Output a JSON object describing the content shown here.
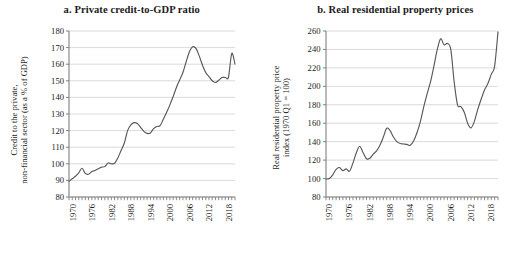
{
  "figure": {
    "background": "#ffffff",
    "line_color": "#595959",
    "grid_color": "#d0d0d0",
    "axis_color": "#808080"
  },
  "panels": [
    {
      "id": "panel-a",
      "title": "a. Private credit-to-GDP ratio",
      "ylabel_line1": "Credit to the private,",
      "ylabel_line2": "non-financial sector (as a % of GDP)"
    },
    {
      "id": "panel-b",
      "title": "b. Real residential property prices",
      "ylabel_line1": "Real residential property price",
      "ylabel_line2": "index (1970 Q1 = 100)"
    }
  ],
  "chart_data": [
    {
      "type": "line",
      "title": "a. Private credit-to-GDP ratio",
      "xlabel": "",
      "ylabel": "Credit to the private, non-financial sector (as a % of GDP)",
      "ylim": [
        80,
        180
      ],
      "ytick_values": [
        80,
        90,
        100,
        110,
        120,
        130,
        140,
        150,
        160,
        170,
        180
      ],
      "ytick_labels": [
        "80",
        "90",
        "100",
        "110",
        "120",
        "130",
        "140",
        "150",
        "160",
        "170",
        "180"
      ],
      "xlim": [
        1970,
        2021
      ],
      "xtick_labels": [
        "1970",
        "1976",
        "1982",
        "1988",
        "1994",
        "2000",
        "2006",
        "2012",
        "2018"
      ],
      "xtick_values": [
        1970,
        1976,
        1982,
        1988,
        1994,
        2000,
        2006,
        2012,
        2018
      ],
      "grid": true,
      "grid_axis": "y",
      "legend": "none",
      "x": [
        1970,
        1971,
        1972,
        1973,
        1974,
        1975,
        1976,
        1977,
        1978,
        1979,
        1980,
        1981,
        1982,
        1983,
        1984,
        1985,
        1986,
        1987,
        1988,
        1989,
        1990,
        1991,
        1992,
        1993,
        1994,
        1995,
        1996,
        1997,
        1998,
        1999,
        2000,
        2001,
        2002,
        2003,
        2004,
        2005,
        2006,
        2007,
        2008,
        2009,
        2010,
        2011,
        2012,
        2013,
        2014,
        2015,
        2016,
        2017,
        2018,
        2019,
        2020,
        2021
      ],
      "values": [
        89.5,
        91.0,
        92.5,
        94.5,
        97.3,
        94.2,
        93.7,
        95.3,
        96.0,
        97.0,
        98.0,
        98.3,
        100.5,
        100.0,
        100.3,
        103.5,
        108.0,
        112.5,
        120.0,
        123.5,
        124.8,
        124.3,
        122.0,
        119.5,
        118.3,
        118.6,
        121.2,
        122.5,
        123.0,
        127.0,
        131.0,
        135.5,
        140.5,
        146.0,
        150.5,
        155.0,
        161.5,
        167.5,
        170.5,
        169.5,
        165.0,
        159.5,
        155.0,
        152.5,
        150.0,
        149.0,
        150.3,
        152.0,
        152.0,
        152.3,
        166.5,
        160.0
      ]
    },
    {
      "type": "line",
      "title": "b. Real residential property prices",
      "xlabel": "",
      "ylabel": "Real residential property price index (1970 Q1 = 100)",
      "ylim": [
        80,
        260
      ],
      "ytick_values": [
        80,
        100,
        120,
        140,
        160,
        180,
        200,
        220,
        240,
        260
      ],
      "ytick_labels": [
        "80",
        "100",
        "120",
        "140",
        "160",
        "180",
        "200",
        "220",
        "240",
        "260"
      ],
      "xlim": [
        1970,
        2021
      ],
      "xtick_labels": [
        "1970",
        "1976",
        "1982",
        "1988",
        "1994",
        "2000",
        "2006",
        "2012",
        "2018"
      ],
      "xtick_values": [
        1970,
        1976,
        1982,
        1988,
        1994,
        2000,
        2006,
        2012,
        2018
      ],
      "grid": true,
      "grid_axis": "y",
      "legend": "none",
      "x": [
        1970,
        1971,
        1972,
        1973,
        1974,
        1975,
        1976,
        1977,
        1978,
        1979,
        1980,
        1981,
        1982,
        1983,
        1984,
        1985,
        1986,
        1987,
        1988,
        1989,
        1990,
        1991,
        1992,
        1993,
        1994,
        1995,
        1996,
        1997,
        1998,
        1999,
        2000,
        2001,
        2002,
        2003,
        2004,
        2005,
        2006,
        2007,
        2008,
        2009,
        2010,
        2011,
        2012,
        2013,
        2014,
        2015,
        2016,
        2017,
        2018,
        2019,
        2020,
        2021
      ],
      "values": [
        99.5,
        100.0,
        104.0,
        110.0,
        112.0,
        108.5,
        110.5,
        108.0,
        117.0,
        128.0,
        135.0,
        128.0,
        121.5,
        122.0,
        126.5,
        130.0,
        136.0,
        145.0,
        154.5,
        152.0,
        145.0,
        140.0,
        138.0,
        137.5,
        137.0,
        136.0,
        141.0,
        150.0,
        162.0,
        178.0,
        192.0,
        205.0,
        222.0,
        240.0,
        251.5,
        245.0,
        246.5,
        240.0,
        205.0,
        180.0,
        178.0,
        172.0,
        160.0,
        155.0,
        162.0,
        175.0,
        186.0,
        196.0,
        203.0,
        213.0,
        222.0,
        259.0
      ]
    }
  ]
}
